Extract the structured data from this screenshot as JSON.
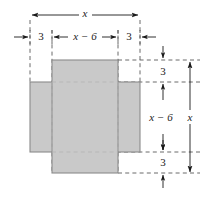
{
  "figure": {
    "colors": {
      "fill": "#c9c9c9",
      "stroke": "#8a8a8a",
      "line": "#1a1a1a",
      "dashed": "#555555",
      "background": "#ffffff"
    },
    "shapes": [
      {
        "name": "horizontal-rectangle",
        "x": 30,
        "y": 82,
        "width": 110,
        "height": 70,
        "fill": "#c9c9c9"
      },
      {
        "name": "vertical-rectangle",
        "x": 52,
        "y": 60,
        "width": 66,
        "height": 113,
        "fill": "#c9c9c9"
      }
    ],
    "guides": {
      "vertical_x": [
        30,
        52,
        118,
        140
      ],
      "horizontal_y": [
        60,
        82,
        152,
        173
      ]
    },
    "dimensions": {
      "top_overall": {
        "name": "top-overall-dimension",
        "label": "x",
        "italic": true,
        "x1": 30,
        "x2": 140,
        "y": 15,
        "label_x": 85,
        "label_y": 13
      },
      "top_segments": [
        {
          "name": "top-left-margin-dimension",
          "label": "3",
          "italic": false,
          "x1": 30,
          "x2": 52,
          "y": 37,
          "label_x": 41,
          "label_y": 36,
          "arrow_style": "outward"
        },
        {
          "name": "top-middle-dimension",
          "label": "x − 6",
          "italic": true,
          "x1": 52,
          "x2": 118,
          "y": 37,
          "label_x": 85,
          "label_y": 36,
          "arrow_style": "inward"
        },
        {
          "name": "top-right-margin-dimension",
          "label": "3",
          "italic": false,
          "x1": 118,
          "x2": 140,
          "y": 37,
          "label_x": 129,
          "label_y": 36,
          "arrow_style": "outward"
        }
      ],
      "right_segments": [
        {
          "name": "right-top-margin-dimension",
          "label": "3",
          "italic": false,
          "y1": 60,
          "y2": 82,
          "x": 163,
          "label_x": 163,
          "label_y": 71,
          "arrow_style": "outward"
        },
        {
          "name": "right-middle-dimension",
          "label": "x − 6",
          "italic": true,
          "y1": 82,
          "y2": 152,
          "x": 163,
          "label_x": 160,
          "label_y": 117,
          "arrow_style": "inward"
        },
        {
          "name": "right-bottom-margin-dimension",
          "label": "3",
          "italic": false,
          "y1": 152,
          "y2": 173,
          "x": 163,
          "label_x": 163,
          "label_y": 162,
          "arrow_style": "outward"
        }
      ],
      "right_overall": {
        "name": "right-overall-dimension",
        "label": "x",
        "italic": true,
        "y1": 62,
        "y2": 172,
        "x": 190,
        "label_x": 181,
        "label_y": 117
      }
    },
    "labels": {
      "top_overall_text": "x",
      "top_left_text": "3",
      "top_middle_text": "x − 6",
      "top_right_text": "3",
      "right_top_text": "3",
      "right_middle_text": "x − 6",
      "right_bottom_text": "3",
      "right_overall_text": "x"
    }
  }
}
